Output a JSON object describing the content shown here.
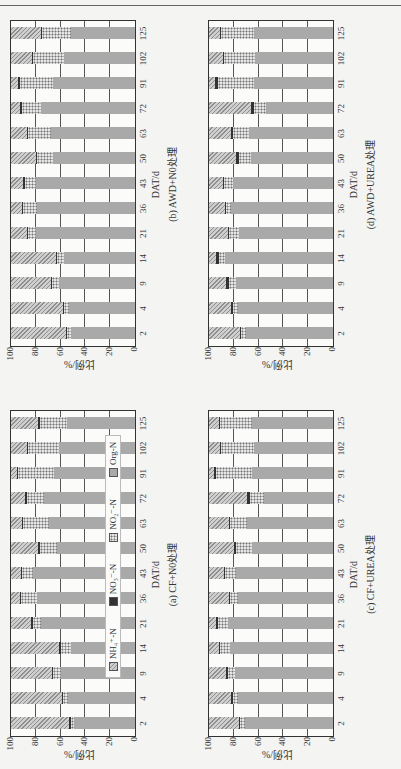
{
  "figure": {
    "ylabel": "比例/%",
    "xlabel": "DAT/d",
    "yticks": [
      "0",
      "20",
      "40",
      "60",
      "80",
      "100"
    ],
    "legend": [
      {
        "key": "nh4",
        "label": "NH₄⁺-N"
      },
      {
        "key": "no3",
        "label": "NO₃⁻-N"
      },
      {
        "key": "no2",
        "label": "NO₂⁻-N"
      },
      {
        "key": "org",
        "label": "Org-N"
      }
    ]
  },
  "chart_data": [
    {
      "id": "a",
      "type": "bar",
      "stacked": true,
      "title": "(a) CF+N0处理",
      "xlabel": "DAT/d",
      "ylabel": "比例/%",
      "ylim": [
        0,
        100
      ],
      "categories": [
        "2",
        "4",
        "9",
        "14",
        "21",
        "36",
        "43",
        "50",
        "63",
        "72",
        "91",
        "102",
        "125"
      ],
      "series": [
        {
          "name": "Org-N",
          "values": [
            49,
            54,
            60,
            52,
            76,
            79,
            82,
            63,
            69,
            73,
            65,
            61,
            55
          ]
        },
        {
          "name": "NO₂⁻-N",
          "values": [
            3,
            4,
            6,
            8,
            6,
            13,
            9,
            14,
            21,
            14,
            29,
            25,
            22
          ]
        },
        {
          "name": "NO₃⁻-N",
          "values": [
            1,
            1,
            1,
            1,
            2,
            1,
            1,
            1,
            1,
            2,
            1,
            1,
            1
          ]
        },
        {
          "name": "NH₄⁺-N",
          "values": [
            47,
            41,
            33,
            39,
            16,
            7,
            8,
            22,
            9,
            11,
            5,
            13,
            22
          ]
        }
      ],
      "legend_position": "inside-bottom"
    },
    {
      "id": "b",
      "type": "bar",
      "stacked": true,
      "title": "(b) AWD+N0处理",
      "xlabel": "DAT/d",
      "ylabel": "比例/%",
      "ylim": [
        0,
        100
      ],
      "categories": [
        "2",
        "4",
        "9",
        "14",
        "21",
        "36",
        "43",
        "50",
        "63",
        "72",
        "91",
        "102",
        "125"
      ],
      "series": [
        {
          "name": "Org-N",
          "values": [
            52,
            53,
            61,
            57,
            80,
            79,
            80,
            66,
            68,
            76,
            66,
            57,
            52
          ]
        },
        {
          "name": "NO₂⁻-N",
          "values": [
            3,
            4,
            6,
            6,
            6,
            11,
            9,
            13,
            18,
            15,
            27,
            25,
            23
          ]
        },
        {
          "name": "NO₃⁻-N",
          "values": [
            1,
            1,
            1,
            1,
            1,
            1,
            1,
            1,
            1,
            2,
            1,
            1,
            1
          ]
        },
        {
          "name": "NH₄⁺-N",
          "values": [
            44,
            42,
            32,
            36,
            13,
            9,
            10,
            20,
            13,
            7,
            6,
            17,
            24
          ]
        }
      ]
    },
    {
      "id": "c",
      "type": "bar",
      "stacked": true,
      "title": "(c) CF+UREA处理",
      "xlabel": "DAT/d",
      "ylabel": "比例/%",
      "ylim": [
        0,
        100
      ],
      "categories": [
        "2",
        "4",
        "9",
        "14",
        "21",
        "36",
        "43",
        "50",
        "63",
        "72",
        "91",
        "102",
        "125"
      ],
      "series": [
        {
          "name": "Org-N",
          "values": [
            71,
            77,
            79,
            83,
            85,
            77,
            78,
            65,
            69,
            56,
            65,
            64,
            65
          ]
        },
        {
          "name": "NO₂⁻-N",
          "values": [
            4,
            4,
            6,
            8,
            8,
            6,
            9,
            13,
            14,
            11,
            29,
            26,
            26
          ]
        },
        {
          "name": "NO₃⁻-N",
          "values": [
            1,
            1,
            1,
            1,
            1,
            1,
            1,
            2,
            1,
            2,
            2,
            1,
            1
          ]
        },
        {
          "name": "NH₄⁺-N",
          "values": [
            24,
            18,
            14,
            8,
            6,
            16,
            12,
            20,
            16,
            31,
            4,
            9,
            8
          ]
        }
      ]
    },
    {
      "id": "d",
      "type": "bar",
      "stacked": true,
      "title": "(d) AWD+UREA处理",
      "xlabel": "DAT/d",
      "ylabel": "比例/%",
      "ylim": [
        0,
        100
      ],
      "categories": [
        "2",
        "4",
        "9",
        "14",
        "21",
        "36",
        "43",
        "50",
        "63",
        "72",
        "91",
        "102",
        "125"
      ],
      "series": [
        {
          "name": "Org-N",
          "values": [
            70,
            77,
            78,
            87,
            76,
            82,
            81,
            66,
            68,
            54,
            64,
            63,
            64
          ]
        },
        {
          "name": "NO₂⁻-N",
          "values": [
            4,
            4,
            6,
            5,
            8,
            4,
            7,
            10,
            13,
            10,
            29,
            25,
            26
          ]
        },
        {
          "name": "NO₃⁻-N",
          "values": [
            1,
            1,
            2,
            2,
            1,
            1,
            1,
            2,
            1,
            2,
            2,
            1,
            1
          ]
        },
        {
          "name": "NH₄⁺-N",
          "values": [
            25,
            18,
            14,
            6,
            15,
            13,
            11,
            22,
            18,
            34,
            5,
            11,
            9
          ]
        }
      ]
    }
  ]
}
